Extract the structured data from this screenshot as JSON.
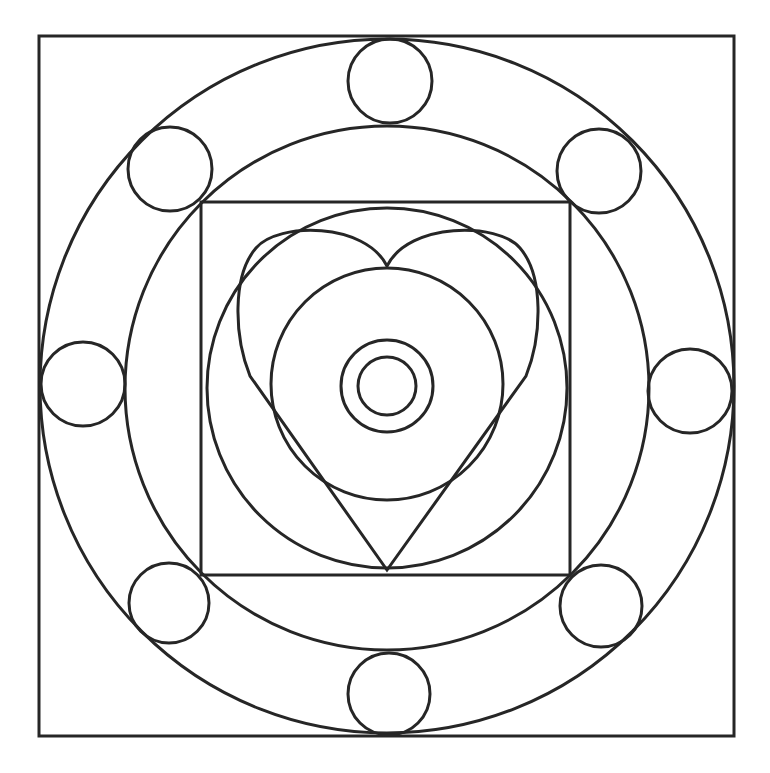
{
  "artwork": {
    "type": "mandala-coloring-page",
    "title": "Heart mandala line art",
    "stroke_color": "#262626",
    "background_color": "#ffffff",
    "shapes": {
      "outer_square": {
        "x": 39,
        "y": 36,
        "width": 695,
        "height": 700
      },
      "outer_ring_circle": {
        "cx": 387,
        "cy": 386,
        "r": 347
      },
      "middle_ring_circle": {
        "cx": 387,
        "cy": 388,
        "r": 262
      },
      "inner_square": {
        "x": 201,
        "y": 202,
        "width": 369,
        "height": 373
      },
      "inner_circle": {
        "cx": 387,
        "cy": 388,
        "r": 180
      },
      "heart_core_circle": {
        "cx": 387,
        "cy": 384,
        "r": 116
      },
      "center_ring_outer": {
        "cx": 387,
        "cy": 386,
        "r": 46
      },
      "center_ring_inner": {
        "cx": 387,
        "cy": 386,
        "r": 29
      },
      "heart": {
        "top_notch": [
          387,
          266
        ],
        "bottom_tip": [
          387,
          570
        ],
        "left_edge_x": 238,
        "right_edge_x": 538,
        "lobe_top_y": 236
      },
      "satellite_circles": [
        {
          "position": "top",
          "cx": 390,
          "cy": 81,
          "r": 42
        },
        {
          "position": "top-right",
          "cx": 599,
          "cy": 171,
          "r": 42
        },
        {
          "position": "right",
          "cx": 690,
          "cy": 391,
          "r": 42
        },
        {
          "position": "bottom-right",
          "cx": 601,
          "cy": 606,
          "r": 41
        },
        {
          "position": "bottom",
          "cx": 389,
          "cy": 694,
          "r": 41
        },
        {
          "position": "bottom-left",
          "cx": 169,
          "cy": 603,
          "r": 40
        },
        {
          "position": "left",
          "cx": 83,
          "cy": 384,
          "r": 42
        },
        {
          "position": "top-left",
          "cx": 170,
          "cy": 169,
          "r": 42
        }
      ]
    }
  }
}
